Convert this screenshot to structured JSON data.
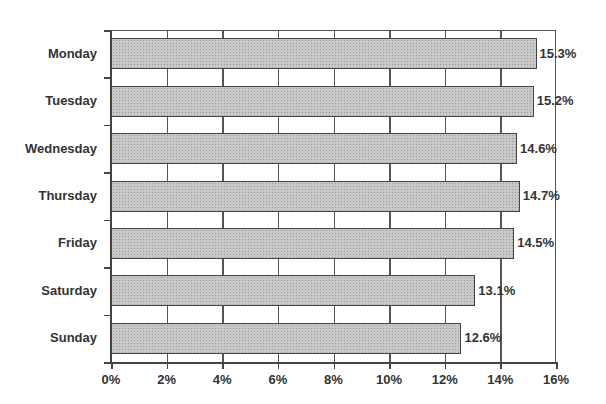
{
  "chart_data": {
    "type": "bar",
    "orientation": "horizontal",
    "title": "",
    "xlabel": "",
    "ylabel": "",
    "categories": [
      "Monday",
      "Tuesday",
      "Wednesday",
      "Thursday",
      "Friday",
      "Saturday",
      "Sunday"
    ],
    "values": [
      15.3,
      15.2,
      14.6,
      14.7,
      14.5,
      13.1,
      12.6
    ],
    "value_labels": [
      "15.3%",
      "15.2%",
      "14.6%",
      "14.7%",
      "14.5%",
      "13.1%",
      "12.6%"
    ],
    "xlim": [
      0,
      16
    ],
    "x_ticks": [
      "0%",
      "2%",
      "4%",
      "6%",
      "8%",
      "10%",
      "12%",
      "14%",
      "16%"
    ],
    "grid": {
      "vertical": true,
      "horizontal": false
    },
    "legend": null,
    "bar_color": "#c8c8c8",
    "bar_border": "#444444"
  }
}
